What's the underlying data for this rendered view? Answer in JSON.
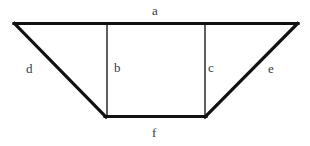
{
  "figure": {
    "background_color": "#ffffff",
    "outline_color": "#111111",
    "inner_line_color": "#2b2b2b",
    "label_color": "#3a3a3a",
    "labels": {
      "a": "a",
      "b": "b",
      "c": "c",
      "d": "d",
      "e": "e",
      "f": "f"
    },
    "label_positions": {
      "a": {
        "x": 152,
        "y": 4
      },
      "b": {
        "x": 114,
        "y": 61
      },
      "c": {
        "x": 208,
        "y": 61
      },
      "d": {
        "x": 26,
        "y": 62
      },
      "e": {
        "x": 268,
        "y": 62
      },
      "f": {
        "x": 152,
        "y": 126
      }
    },
    "vertices": {
      "top_left": {
        "x": 14,
        "y": 23
      },
      "top_right": {
        "x": 298,
        "y": 23
      },
      "bottom_left": {
        "x": 106,
        "y": 117
      },
      "bottom_right": {
        "x": 205,
        "y": 117
      }
    },
    "segments": {
      "a": "top edge from top-left to top-right",
      "d": "left slanted side from top-left to bottom-left",
      "e": "right slanted side from top-right to bottom-right",
      "f": "bottom edge from bottom-left to bottom-right",
      "b": "left vertical from top edge down to bottom-left",
      "c": "right vertical from top edge down to bottom-right"
    }
  }
}
